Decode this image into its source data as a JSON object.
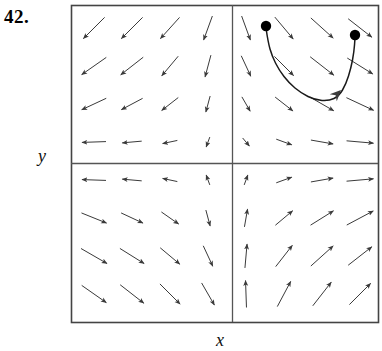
{
  "figure": {
    "problem_number": "42.",
    "axis_label_x": "x",
    "axis_label_y": "y",
    "plot_box": {
      "left": 71,
      "top": 5,
      "right": 378,
      "bottom": 322
    },
    "axes_origin": {
      "x": 232,
      "y": 163
    },
    "colors": {
      "border": "#444444",
      "axis": "#555555",
      "arrow": "#3a3a3a",
      "curve": "#1a1a1a",
      "dot": "#000000",
      "background": "#ffffff",
      "text": "#000000"
    }
  },
  "chart_data": {
    "type": "scatter",
    "title": "",
    "subtitle": "",
    "xlabel": "x",
    "ylabel": "y",
    "grid": false,
    "legend_position": "none",
    "plot_kind": "direction-field",
    "xlim": [
      -4,
      4
    ],
    "ylim": [
      -4,
      4
    ],
    "axis_ticks": {
      "x": [],
      "y": []
    },
    "grid_positions": {
      "x": [
        -3.5,
        -2.5,
        -1.5,
        -0.5,
        0.5,
        1.5,
        2.5,
        3.5
      ],
      "y": [
        3.5,
        2.5,
        1.5,
        0.5,
        -0.5,
        -1.5,
        -2.5,
        -3.5
      ]
    },
    "annotations": [
      {
        "label": "42.",
        "kind": "problem-number"
      },
      {
        "label": "x",
        "kind": "axis-label"
      },
      {
        "label": "y",
        "kind": "axis-label"
      }
    ],
    "marked_points": [
      {
        "name": "start-point",
        "px": [
          266,
          26
        ],
        "data": [
          0.45,
          3.45
        ]
      },
      {
        "name": "end-point",
        "px": [
          355,
          35
        ],
        "data": [
          3.2,
          3.25
        ]
      }
    ],
    "trajectory": {
      "name": "solution-curve",
      "arrowhead_px": [
        341,
        90
      ],
      "arrowhead_direction_deg": 45,
      "points_px": [
        [
          266,
          28
        ],
        [
          268,
          42
        ],
        [
          272,
          56
        ],
        [
          279,
          70
        ],
        [
          289,
          83
        ],
        [
          301,
          93
        ],
        [
          315,
          100
        ],
        [
          329,
          101
        ],
        [
          339,
          96
        ],
        [
          346,
          84
        ],
        [
          351,
          68
        ],
        [
          354,
          52
        ],
        [
          355,
          38
        ]
      ]
    },
    "vector_field": {
      "spacing_px": 38,
      "origin_px": [
        94,
        28
      ],
      "arrow_length_px": 30,
      "note": "Angles measured counter-clockwise from +x axis, in degrees, per grid node. Row 0 is the top row. Column 0 is the leftmost column. Length factor 0..1 scales the drawn arrow.",
      "rows": [
        {
          "row": 0,
          "y_data": 3.5,
          "angles": [
            225,
            225,
            228,
            250,
            290,
            310,
            318,
            322
          ],
          "lengths": [
            1.0,
            1.0,
            0.95,
            0.85,
            0.85,
            0.95,
            1.0,
            1.0
          ]
        },
        {
          "row": 1,
          "y_data": 2.5,
          "angles": [
            215,
            218,
            230,
            255,
            295,
            315,
            322,
            328
          ],
          "lengths": [
            1.0,
            0.95,
            0.85,
            0.75,
            0.75,
            0.9,
            1.0,
            1.0
          ]
        },
        {
          "row": 2,
          "y_data": 1.5,
          "angles": [
            205,
            208,
            218,
            255,
            300,
            322,
            330,
            335
          ],
          "lengths": [
            0.9,
            0.8,
            0.7,
            0.55,
            0.55,
            0.75,
            0.9,
            1.0
          ]
        },
        {
          "row": 3,
          "y_data": 0.5,
          "angles": [
            182,
            185,
            192,
            250,
            310,
            340,
            350,
            355
          ],
          "lengths": [
            0.8,
            0.65,
            0.5,
            0.35,
            0.35,
            0.55,
            0.75,
            0.9
          ]
        },
        {
          "row": 4,
          "y_data": -0.5,
          "angles": [
            178,
            175,
            168,
            110,
            70,
            20,
            10,
            5
          ],
          "lengths": [
            0.8,
            0.65,
            0.5,
            0.35,
            0.35,
            0.55,
            0.75,
            0.9
          ]
        },
        {
          "row": 5,
          "y_data": -1.5,
          "angles": [
            338,
            335,
            325,
            285,
            80,
            40,
            32,
            28
          ],
          "lengths": [
            0.9,
            0.8,
            0.7,
            0.55,
            0.6,
            0.75,
            0.9,
            1.0
          ]
        },
        {
          "row": 6,
          "y_data": -2.5,
          "angles": [
            330,
            328,
            320,
            295,
            85,
            52,
            42,
            38
          ],
          "lengths": [
            1.0,
            0.95,
            0.85,
            0.75,
            0.8,
            0.9,
            1.0,
            1.0
          ]
        },
        {
          "row": 7,
          "y_data": -3.5,
          "angles": [
            325,
            322,
            315,
            300,
            92,
            62,
            52,
            45
          ],
          "lengths": [
            1.0,
            1.0,
            0.95,
            0.85,
            0.9,
            0.95,
            1.0,
            1.0
          ]
        }
      ]
    }
  }
}
